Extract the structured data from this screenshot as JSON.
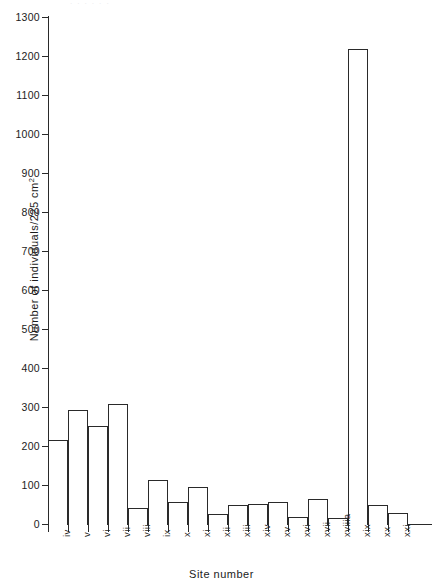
{
  "page": {
    "bleed_text": "·  ·   ·        ·          ·                 ·"
  },
  "chart_data": {
    "type": "bar",
    "title": "",
    "xlabel": "Site number",
    "ylabel": "Number of individuals/225 cm",
    "ylabel_superscript": "2",
    "categories": [
      "iv",
      "v",
      "vi",
      "vii",
      "viii",
      "ix",
      "x",
      "xi",
      "xii",
      "xiii",
      "xiv",
      "xv",
      "xvi",
      "xvii",
      "xviiia",
      "xix",
      "xx",
      "xxi"
    ],
    "values": [
      215,
      292,
      252,
      308,
      42,
      112,
      57,
      95,
      25,
      50,
      52,
      57,
      18,
      65,
      15,
      1218,
      50,
      27
    ],
    "ylim": [
      0,
      1300
    ],
    "yticks": [
      0,
      100,
      200,
      300,
      400,
      500,
      600,
      700,
      800,
      900,
      1000,
      1100,
      1200,
      1300
    ],
    "ytick_labels": [
      "0",
      "100",
      "200",
      "300",
      "400",
      "500",
      "600",
      "700",
      "800",
      "900",
      "1000",
      "1100",
      "1200",
      "1300"
    ],
    "grid": false,
    "legend": null,
    "bar_style": "outline",
    "bar_color": "#2a2a2a",
    "bar_fill": "#ffffff"
  }
}
